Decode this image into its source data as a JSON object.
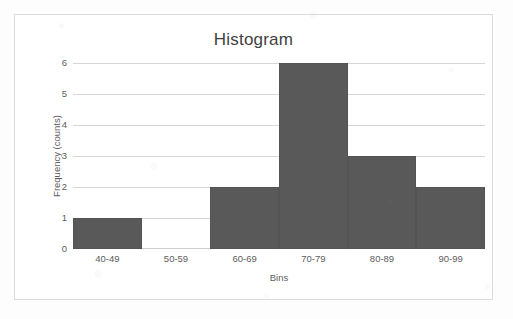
{
  "chart_data": {
    "type": "bar",
    "title": "Histogram",
    "xlabel": "Bins",
    "ylabel": "Frequency (counts)",
    "categories": [
      "40-49",
      "50-59",
      "60-69",
      "70-79",
      "80-89",
      "90-99"
    ],
    "values": [
      1,
      0,
      2,
      6,
      3,
      2
    ],
    "ylim": [
      0,
      6
    ],
    "y_ticks": [
      6,
      5,
      4,
      3,
      2,
      1,
      0
    ],
    "grid": "horizontal",
    "legend": "none",
    "bar_color": "#595959",
    "gridline_color": "#d7d7d7",
    "plot_border_color": "#dcdcdc",
    "background_color": "#ffffff",
    "title_color": "#3f3f3f",
    "label_color": "#5c5c5c"
  }
}
